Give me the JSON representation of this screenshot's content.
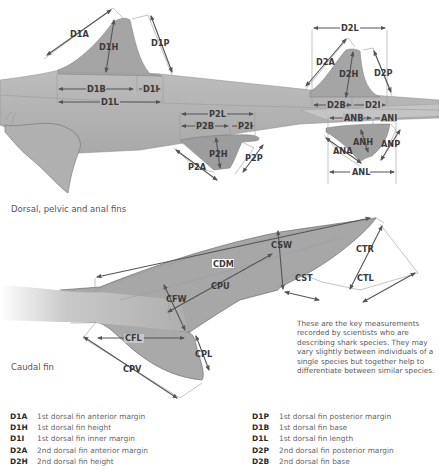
{
  "sections": {
    "fins_title": "Dorsal, pelvic and anal fins",
    "caudal_title": "Caudal fin"
  },
  "labels": {
    "D1A": "D1A",
    "D1H": "D1H",
    "D1P": "D1P",
    "D1B": "D1B",
    "D1I": "D1I",
    "D1L": "D1L",
    "D2L": "D2L",
    "D2A": "D2A",
    "D2H": "D2H",
    "D2P": "D2P",
    "D2B": "D2B",
    "D2I": "D2I",
    "P2L": "P2L",
    "P2B": "P2B",
    "P2I": "P2I",
    "P2H": "P2H",
    "P2A": "P2A",
    "P2P": "P2P",
    "ANB": "ANB",
    "ANI": "ANI",
    "ANA": "ANA",
    "ANH": "ANH",
    "ANP": "ANP",
    "ANL": "ANL",
    "CDM": "CDM",
    "CSW": "CSW",
    "CPU": "CPU",
    "CFW": "CFW",
    "CST": "CST",
    "CTR": "CTR",
    "CTL": "CTL",
    "CFL": "CFL",
    "CPL": "CPL",
    "CPV": "CPV"
  },
  "note": "These are the key measurements recorded by scientists who are describing shark species. They may vary slightly between individuals of a single species but together help to differentiate between similar species.",
  "legend": {
    "left": [
      {
        "code": "D1A",
        "desc": "1st dorsal fin anterior margin"
      },
      {
        "code": "D1H",
        "desc": "1st dorsal fin height"
      },
      {
        "code": "D1I",
        "desc": "1st dorsal fin inner margin"
      },
      {
        "code": "D2A",
        "desc": "2nd dorsal fin anterior margin"
      },
      {
        "code": "D2H",
        "desc": "2nd dorsal fin height"
      }
    ],
    "right": [
      {
        "code": "D1P",
        "desc": "1st dorsal fin posterior margin"
      },
      {
        "code": "D1B",
        "desc": "1st dorsal fin base"
      },
      {
        "code": "D1L",
        "desc": "1st dorsal fin length"
      },
      {
        "code": "D2P",
        "desc": "2nd dorsal fin posterior margin"
      },
      {
        "code": "D2B",
        "desc": "2nd dorsal fin base"
      }
    ]
  },
  "colors": {
    "body": "#b4b4b4",
    "fin": "#a2a2a2",
    "line": "#555555",
    "text": "#3a3a3a"
  }
}
